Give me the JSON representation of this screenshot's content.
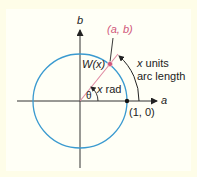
{
  "diagram": {
    "type": "unit-circle",
    "colors": {
      "background": "#fefde8",
      "panel": "#fffff6",
      "circle": "#3a9ad0",
      "ray": "#e08aa2",
      "point_ab": "#d0577a",
      "axes": "#333333",
      "text": "#222222"
    },
    "axes": {
      "horizontal_label": "a",
      "vertical_label": "b"
    },
    "labels": {
      "point": "(a, b)",
      "wrapping_function": "W(x)",
      "theta": "θ",
      "angle_rad_var": "x",
      "angle_rad_unit": " rad",
      "arc_line1_var": "x",
      "arc_line1_rest": " units",
      "arc_line2": "arc length",
      "unit_point": "(1, 0)"
    }
  }
}
